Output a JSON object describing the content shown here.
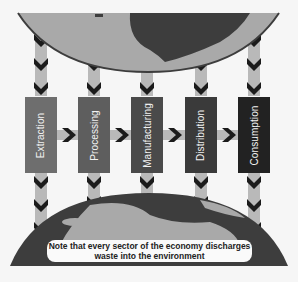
{
  "diagram": {
    "stages": [
      {
        "label": "Extraction",
        "color": "#6e6e6e"
      },
      {
        "label": "Processing",
        "color": "#5e5e5e"
      },
      {
        "label": "Manufacturing",
        "color": "#4a4a4a"
      },
      {
        "label": "Distribution",
        "color": "#3a3a3a"
      },
      {
        "label": "Consumption",
        "color": "#222222"
      }
    ],
    "note": {
      "line1": "Note that every sector of the economy discharges",
      "line2": "waste into the environment"
    },
    "colors": {
      "earth_land_dark": "#3d3d3d",
      "earth_ocean_light": "#a9a9a9",
      "arrow_shaft": "#b9b9b9",
      "chevron": "#1b1b1b"
    }
  }
}
